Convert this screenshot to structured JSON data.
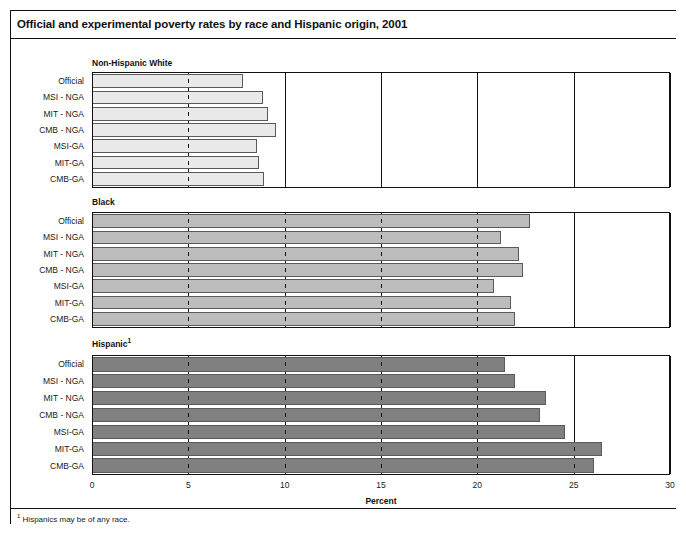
{
  "figure": {
    "title": "Official and experimental poverty rates by race and Hispanic origin, 2001",
    "footnote_marker": "1",
    "footnote_text": "Hispanics may be of any race."
  },
  "chart_data": {
    "type": "bar",
    "orientation": "horizontal",
    "title": "Official and experimental poverty rates by race and Hispanic origin, 2001",
    "xlabel": "Percent",
    "ylabel": "",
    "xlim": [
      0,
      30
    ],
    "xticks": [
      0,
      5,
      10,
      15,
      20,
      25,
      30
    ],
    "xtick_labels": [
      "0",
      "5",
      "10",
      "15",
      "20",
      "25",
      "30"
    ],
    "grid": true,
    "legend": "none",
    "categories": [
      "Official",
      "MSI - NGA",
      "MIT - NGA",
      "CMB - NGA",
      "MSI-GA",
      "MIT-GA",
      "CMB-GA"
    ],
    "panels": [
      {
        "name": "Non-Hispanic White",
        "label": "Non-Hispanic White",
        "footnote_marker": "",
        "bar_color": "#e9e9e9",
        "values": [
          7.8,
          8.8,
          9.1,
          9.5,
          8.5,
          8.6,
          8.9
        ]
      },
      {
        "name": "Black",
        "label": "Black",
        "footnote_marker": "",
        "bar_color": "#bcbcbc",
        "values": [
          22.7,
          21.2,
          22.1,
          22.3,
          20.8,
          21.7,
          21.9
        ]
      },
      {
        "name": "Hispanic",
        "label": "Hispanic",
        "footnote_marker": "1",
        "bar_color": "#808080",
        "values": [
          21.4,
          21.9,
          23.5,
          23.2,
          24.5,
          26.4,
          26.0
        ]
      }
    ]
  }
}
